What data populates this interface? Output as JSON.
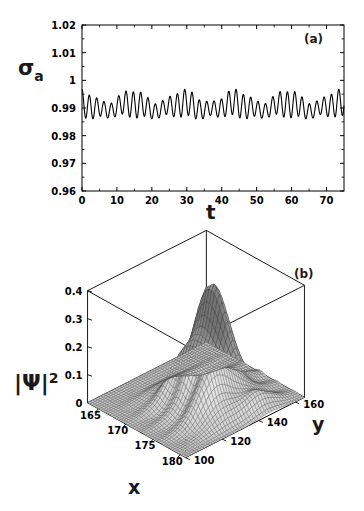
{
  "figure": {
    "background": "#ffffff",
    "line_color": "#000000",
    "panels": [
      "a",
      "b"
    ]
  },
  "panel_a": {
    "tag": "(a)",
    "ylabel_main": "σ",
    "ylabel_sub": "a",
    "xlabel": "t"
  },
  "panel_b": {
    "tag": "(b)",
    "zlabel_main": "|Ψ|",
    "zlabel_exp": "2",
    "xlabel": "x",
    "ylabel": "y"
  },
  "chart_data": [
    {
      "type": "line",
      "id": "panel-a",
      "title": "(a)",
      "xlabel": "t",
      "ylabel": "σ_a",
      "xlim": [
        0,
        75
      ],
      "ylim": [
        0.96,
        1.02
      ],
      "xticks": [
        0,
        10,
        20,
        30,
        40,
        50,
        60,
        70
      ],
      "xticklabels": [
        "0",
        "10",
        "20",
        "30",
        "40",
        "50",
        "60",
        "70"
      ],
      "yticks": [
        0.96,
        0.97,
        0.98,
        0.99,
        1.0,
        1.01,
        1.02
      ],
      "yticklabels": [
        "0.96",
        "0.97",
        "0.98",
        "0.99",
        "1",
        "1.01",
        "1.02"
      ],
      "grid": false,
      "legend": false,
      "description": "Quasi-periodic oscillation of atomic inversion sigma_a about 0.990 with fast carrier period ~2.1 and a slow beat envelope of period ~14.8; amplitude modulated between ~0.983 and ~0.999.",
      "model": {
        "baseline": 0.9905,
        "fast_period": 2.1,
        "fast_amplitude": 0.0048,
        "envelope_period": 14.8,
        "envelope_depth": 0.45,
        "slow_period": 14.8,
        "slow_amplitude": 0.0012,
        "initial_value": 1.0
      },
      "x": [
        0,
        5,
        10,
        15,
        20,
        25,
        30,
        35,
        40,
        45,
        50,
        55,
        60,
        65,
        70,
        75
      ],
      "y": [
        1.0,
        0.9885,
        0.9905,
        0.9955,
        0.9895,
        0.9885,
        0.9955,
        0.9895,
        0.9885,
        0.9955,
        0.9895,
        0.9885,
        0.9955,
        0.9895,
        0.9885,
        0.9955
      ]
    },
    {
      "type": "surface",
      "id": "panel-b",
      "title": "(b)",
      "xlabel": "x",
      "ylabel": "y",
      "zlabel": "|Ψ|^2",
      "xlim": [
        163,
        181
      ],
      "ylim": [
        100,
        165
      ],
      "zlim": [
        0,
        0.4
      ],
      "xticks": [
        165,
        170,
        175,
        180
      ],
      "xticklabels": [
        "165",
        "170",
        "175",
        "180"
      ],
      "yticks": [
        100,
        120,
        140,
        160
      ],
      "yticklabels": [
        "100",
        "120",
        "140",
        "160"
      ],
      "zticks": [
        0,
        0.1,
        0.2,
        0.3,
        0.4
      ],
      "zticklabels": [
        "0",
        "0.1",
        "0.2",
        "0.3",
        "0.4"
      ],
      "grid": true,
      "legend": false,
      "mesh": {
        "nx": 44,
        "ny": 44,
        "shaded": true,
        "wireframe": true
      },
      "description": "Wavepacket probability density |Psi|^2 over the (x,y) plane: a dominant elongated ridge peaking near 0.38 around x=173, y=138, flanked by lower secondary lobes, on a near-zero flat background.",
      "peaks": [
        {
          "x": 173.0,
          "y": 138.0,
          "z": 0.38,
          "sigma_x": 1.7,
          "sigma_y": 9.0
        },
        {
          "x": 176.5,
          "y": 128.0,
          "z": 0.14,
          "sigma_x": 1.5,
          "sigma_y": 8.0
        },
        {
          "x": 169.8,
          "y": 130.0,
          "z": 0.09,
          "sigma_x": 1.6,
          "sigma_y": 8.0
        },
        {
          "x": 178.5,
          "y": 146.0,
          "z": 0.06,
          "sigma_x": 1.4,
          "sigma_y": 7.0
        }
      ]
    }
  ]
}
